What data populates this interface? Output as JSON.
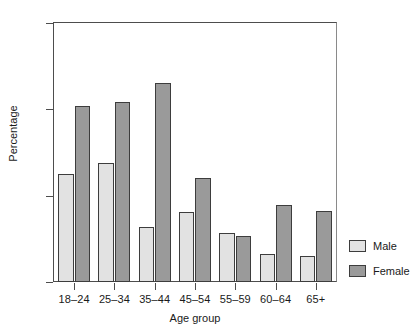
{
  "chart_data": {
    "type": "bar",
    "title": "",
    "xlabel": "Age group",
    "ylabel": "Percentage",
    "categories": [
      "18–24",
      "25–34",
      "35–44",
      "45–54",
      "55–59",
      "60–64",
      "65+"
    ],
    "series": [
      {
        "name": "Male",
        "color": "#e2e2e2",
        "values": [
          12.5,
          13.8,
          6.4,
          8.1,
          5.7,
          3.2,
          3.0
        ]
      },
      {
        "name": "Female",
        "color": "#9a9a9a",
        "values": [
          20.4,
          20.8,
          23.0,
          12.0,
          5.3,
          8.9,
          8.2
        ]
      }
    ],
    "ylim": [
      0,
      30
    ],
    "yticks": [
      0,
      10,
      20,
      30
    ],
    "ytick_labels": [
      "0",
      "10",
      "20",
      "30"
    ],
    "grid": false,
    "legend_position": "right",
    "axis_line_color": "#4d4d4d",
    "bar_border_color": "#3d3d3d",
    "background": "#ffffff"
  },
  "legend": {
    "entries": [
      {
        "label": "Male"
      },
      {
        "label": "Female"
      }
    ]
  }
}
